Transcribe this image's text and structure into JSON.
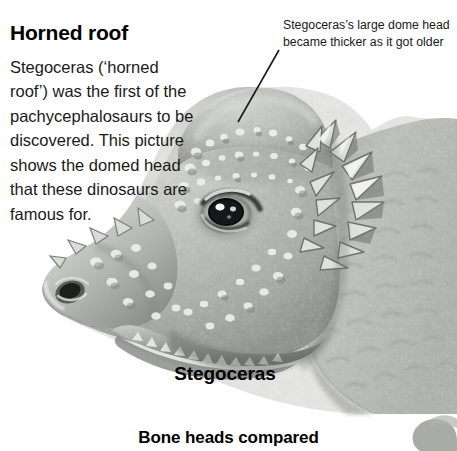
{
  "page": {
    "width": 457,
    "height": 451,
    "background_color": "#ffffff"
  },
  "article": {
    "title": "Horned roof",
    "body": "Stegoceras (‘horned roof’) was the first of the pachycephalosaurs to be discovered. This picture shows the domed head that these dinosaurs are famous for."
  },
  "callout": {
    "text": "Stegoceras’s large dome head became thicker as it got older",
    "leader_line_color": "#1a1a1a"
  },
  "illustration": {
    "subject_label": "Stegoceras",
    "alt_text": "Grayscale illustration of a Stegoceras dinosaur head in profile, facing left, with a large bony dome on the skull and knobby spikes along the jaw and neck",
    "palette": {
      "dome_light": "#cfd0cc",
      "dome_mid": "#a8aaa5",
      "dome_shadow": "#6e7170",
      "outline": "#5a5d5c",
      "bump_highlight": "#f2f2ef",
      "eye_dark": "#111111",
      "neck_mid": "#b9bbb6"
    }
  },
  "figure": {
    "caption": "Bone heads compared"
  },
  "next_figure_hint": {
    "alt_text": "partial gray shape of the next illustration cropped at the bottom-right corner",
    "color": "#9a9c98"
  }
}
